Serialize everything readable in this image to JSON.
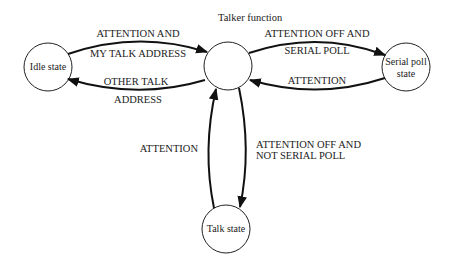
{
  "title": "Talker function",
  "states": {
    "idle": {
      "label": "Idle state"
    },
    "talker": {
      "label": ""
    },
    "serial_poll": {
      "label_line1": "Serial poll",
      "label_line2": "state"
    },
    "talk": {
      "label": "Talk state"
    }
  },
  "transitions": {
    "idle_to_talker": {
      "line1": "ATTENTION AND",
      "line2": "MY TALK ADDRESS"
    },
    "talker_to_idle": {
      "line1": "OTHER TALK",
      "line2": "ADDRESS"
    },
    "talker_to_serial": {
      "line1": "ATTENTION OFF AND",
      "line2": "SERIAL POLL"
    },
    "serial_to_talker": {
      "line1": "ATTENTION"
    },
    "talker_to_talk": {
      "line1": "ATTENTION OFF AND",
      "line2": "NOT SERIAL POLL"
    },
    "talk_to_talker": {
      "line1": "ATTENTION"
    }
  }
}
